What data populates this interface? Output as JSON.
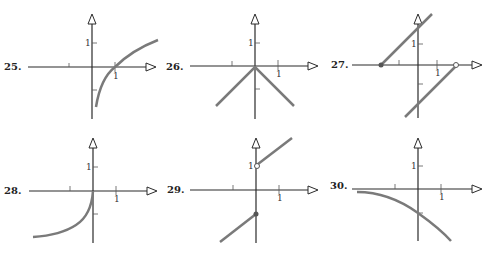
{
  "colors": {
    "axis": "#2a2a2a",
    "curve": "#7a7a7a",
    "tick": "#555555"
  },
  "graphs": [
    {
      "label": "25.",
      "x_tick_label": "1",
      "y_tick_label": "1",
      "description": "logarithmic curve crossing x-axis at 1"
    },
    {
      "label": "26.",
      "x_tick_label": "1",
      "y_tick_label": "1",
      "description": "inverted V (y = -|x|) with vertex at origin"
    },
    {
      "label": "27.",
      "x_tick_label": "1",
      "y_tick_label": "1",
      "description": "two parallel line segments: upper from filled dot at (-2,0), lower ending at open dot (2,0)"
    },
    {
      "label": "28.",
      "x_tick_label": "1",
      "y_tick_label": "1",
      "description": "curve in third quadrant ending at origin"
    },
    {
      "label": "29.",
      "x_tick_label": "1",
      "y_tick_label": "1",
      "description": "line y=x+1 for x>0 with open dot at (0,1); line y=x-1 for x<=0 with filled dot at (0,-1)"
    },
    {
      "label": "30.",
      "x_tick_label": "1",
      "y_tick_label": "1",
      "description": "decreasing concave-down curve through (0,-1)"
    }
  ]
}
